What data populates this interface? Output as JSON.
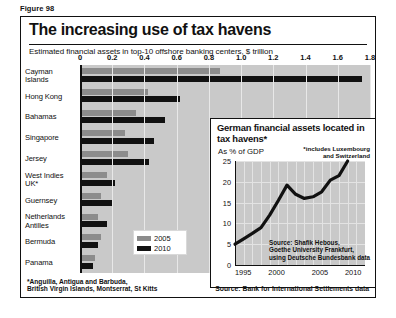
{
  "figure_label": "Figure 98",
  "title": "The increasing use of tax havens",
  "subtitle": "Estimated financial assets in top-10 offshore banking centers, $ trillion",
  "legend": {
    "items": [
      {
        "label": "2005",
        "color": "#8c8c8c"
      },
      {
        "label": "2010",
        "color": "#111111"
      }
    ]
  },
  "footnotes": {
    "left": "*Anguilla, Antigua and Barbuda,\nBritish Virgin Islands, Montserrat, St Kitts",
    "right": "Source: Bank for International Settlements data"
  },
  "inset": {
    "title": "German financial assets located in tax havens*",
    "subtitle": "As % of GDP",
    "note": "*includes Luxembourg and Switzerland",
    "source": "Source: Shafik Hebous,\nGoethe University Frankfurt,\nusing Deutsche Bundesbank data"
  },
  "chart_data": [
    {
      "type": "bar",
      "orientation": "horizontal",
      "title": "The increasing use of tax havens",
      "subtitle": "Estimated financial assets in top-10 offshore banking centers, $ trillion",
      "xlabel": "$ trillion",
      "ylabel": "",
      "xlim": [
        0,
        1.8
      ],
      "xticks": [
        "0",
        "0.2",
        "0.4",
        "0.6",
        "0.8",
        "1.0",
        "1.2",
        "1.4",
        "1.6",
        "1.8"
      ],
      "grid": true,
      "legend_position": "inside-bottom-left",
      "categories": [
        "Cayman Islands",
        "Hong Kong",
        "Bahamas",
        "Singapore",
        "Jersey",
        "West Indies UK*",
        "Guernsey",
        "Netherlands Antilles",
        "Bermuda",
        "Panama"
      ],
      "series": [
        {
          "name": "2005",
          "color": "#8c8c8c",
          "values": [
            0.87,
            0.42,
            0.35,
            0.28,
            0.3,
            0.17,
            0.13,
            0.11,
            0.13,
            0.09
          ]
        },
        {
          "name": "2010",
          "color": "#111111",
          "values": [
            1.75,
            0.62,
            0.53,
            0.46,
            0.43,
            0.22,
            0.2,
            0.17,
            0.11,
            0.08
          ]
        }
      ]
    },
    {
      "type": "line",
      "title": "German financial assets located in tax havens*",
      "subtitle": "As % of GDP",
      "xlabel": "",
      "ylabel": "As % of GDP",
      "xlim": [
        1995,
        2010
      ],
      "ylim": [
        0,
        25
      ],
      "xticks": [
        "1995",
        "2000",
        "2005",
        "2010"
      ],
      "yticks": [
        "0",
        "5",
        "10",
        "15",
        "20",
        "25"
      ],
      "grid": true,
      "annotation": "*includes Luxembourg and Switzerland",
      "source": "Source: Shafik Hebous, Goethe University Frankfurt, using Deutsche Bundesbank data",
      "series": [
        {
          "name": "German financial assets in tax havens",
          "color": "#111111",
          "x": [
            1995,
            1996,
            1997,
            1998,
            1999,
            2000,
            2001,
            2002,
            2003,
            2004,
            2005,
            2006,
            2007,
            2008
          ],
          "values": [
            5.0,
            6.3,
            7.6,
            9.0,
            12.0,
            15.5,
            19.2,
            17.0,
            16.0,
            16.4,
            17.6,
            20.4,
            21.5,
            25.0
          ]
        }
      ]
    }
  ]
}
